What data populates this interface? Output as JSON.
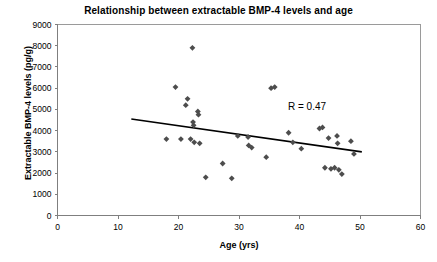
{
  "chart_data": {
    "type": "scatter",
    "title": "Relationship between extractable BMP-4 levels and age",
    "xlabel": "Age (yrs)",
    "ylabel": "Extractable BMP-4 levels (pg/g)",
    "xlim": [
      0,
      60
    ],
    "ylim": [
      0,
      9000
    ],
    "xticks": [
      0,
      10,
      20,
      30,
      40,
      50,
      60
    ],
    "yticks": [
      0,
      1000,
      2000,
      3000,
      4000,
      5000,
      6000,
      7000,
      8000,
      9000
    ],
    "xtick_labels": [
      "0",
      "10",
      "20",
      "30",
      "40",
      "50",
      "60"
    ],
    "ytick_labels": [
      "0",
      "1000",
      "2000",
      "3000",
      "4000",
      "5000",
      "6000",
      "7000",
      "8000",
      "9000"
    ],
    "grid": false,
    "legend": false,
    "marker": "diamond",
    "marker_color": "#4d4d4d",
    "annotations": [
      {
        "text": "R = 0.47",
        "x": 38.5,
        "y": 4900
      }
    ],
    "trendline": {
      "type": "linear",
      "x_start": 12.2,
      "y_start": 4550,
      "x_end": 50.3,
      "y_end": 3000,
      "color": "#000000"
    },
    "x": [
      18.0,
      19.5,
      20.4,
      21.2,
      21.5,
      22.0,
      22.3,
      22.4,
      22.5,
      22.6,
      23.2,
      23.3,
      23.5,
      24.5,
      27.3,
      28.8,
      29.8,
      31.5,
      31.6,
      32.1,
      34.5,
      35.3,
      35.9,
      38.2,
      38.9,
      40.3,
      43.3,
      43.8,
      44.2,
      44.8,
      45.2,
      45.8,
      46.2,
      46.3,
      46.5,
      47.0,
      48.5,
      49.0
    ],
    "y": [
      3600,
      6050,
      3600,
      5200,
      5500,
      3600,
      7900,
      4400,
      4250,
      3450,
      4900,
      4750,
      3400,
      1800,
      2450,
      1750,
      3750,
      3700,
      3300,
      3200,
      2750,
      6000,
      6050,
      3900,
      3450,
      3150,
      4100,
      4150,
      2250,
      3650,
      2200,
      2250,
      3750,
      3400,
      2150,
      1950,
      3500,
      2900
    ],
    "points": [
      {
        "x": 18.0,
        "y": 3600
      },
      {
        "x": 19.5,
        "y": 6050
      },
      {
        "x": 20.4,
        "y": 3600
      },
      {
        "x": 21.2,
        "y": 5200
      },
      {
        "x": 21.5,
        "y": 5500
      },
      {
        "x": 22.0,
        "y": 3600
      },
      {
        "x": 22.3,
        "y": 7900
      },
      {
        "x": 22.4,
        "y": 4400
      },
      {
        "x": 22.5,
        "y": 4250
      },
      {
        "x": 22.6,
        "y": 3450
      },
      {
        "x": 23.2,
        "y": 4900
      },
      {
        "x": 23.3,
        "y": 4750
      },
      {
        "x": 23.5,
        "y": 3400
      },
      {
        "x": 24.5,
        "y": 1800
      },
      {
        "x": 27.3,
        "y": 2450
      },
      {
        "x": 28.8,
        "y": 1750
      },
      {
        "x": 29.8,
        "y": 3750
      },
      {
        "x": 31.5,
        "y": 3700
      },
      {
        "x": 31.6,
        "y": 3300
      },
      {
        "x": 32.1,
        "y": 3200
      },
      {
        "x": 34.5,
        "y": 2750
      },
      {
        "x": 35.3,
        "y": 6000
      },
      {
        "x": 35.9,
        "y": 6050
      },
      {
        "x": 38.2,
        "y": 3900
      },
      {
        "x": 38.9,
        "y": 3450
      },
      {
        "x": 40.3,
        "y": 3150
      },
      {
        "x": 43.3,
        "y": 4100
      },
      {
        "x": 43.8,
        "y": 4150
      },
      {
        "x": 44.2,
        "y": 2250
      },
      {
        "x": 44.8,
        "y": 3650
      },
      {
        "x": 45.2,
        "y": 2200
      },
      {
        "x": 45.8,
        "y": 2250
      },
      {
        "x": 46.2,
        "y": 3750
      },
      {
        "x": 46.3,
        "y": 3400
      },
      {
        "x": 46.5,
        "y": 2150
      },
      {
        "x": 47.0,
        "y": 1950
      },
      {
        "x": 48.5,
        "y": 3500
      },
      {
        "x": 49.0,
        "y": 2900
      }
    ]
  }
}
